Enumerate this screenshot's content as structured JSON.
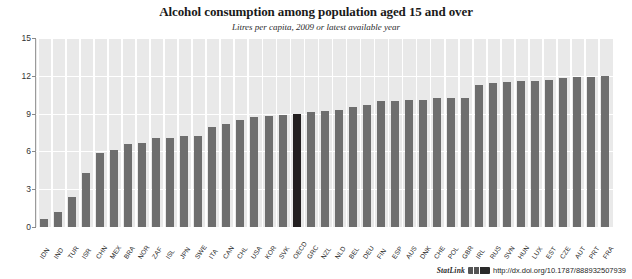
{
  "chart_data": {
    "type": "bar",
    "title": "Alcohol consumption among population aged 15 and over",
    "subtitle": "Litres per capita, 2009 or latest available year",
    "xlabel": "",
    "ylabel": "",
    "ylim": [
      0,
      15
    ],
    "yticks": [
      0,
      3,
      6,
      9,
      12,
      15
    ],
    "grid": "horizontal-and-vertical-white",
    "legend": "none",
    "bar_color": "#6e6e6e",
    "highlight_color": "#231f20",
    "plot_background": "#e9e9e9",
    "highlight_category": "OECD",
    "categories": [
      "IDN",
      "IND",
      "TUR",
      "ISR",
      "CHN",
      "MEX",
      "BRA",
      "NOR",
      "ZAF",
      "ISL",
      "JPN",
      "SWE",
      "ITA",
      "CAN",
      "CHL",
      "USA",
      "KOR",
      "SVK",
      "OECD",
      "GRC",
      "NZL",
      "NLD",
      "BEL",
      "DEU",
      "FIN",
      "ESP",
      "AUS",
      "DNK",
      "CHE",
      "POL",
      "GBR",
      "IRL",
      "RUS",
      "SVN",
      "HUN",
      "LUX",
      "EST",
      "CZE",
      "AUT",
      "PRT",
      "FRA"
    ],
    "values": [
      0.6,
      1.2,
      2.4,
      4.3,
      5.9,
      6.1,
      6.6,
      6.7,
      7.1,
      7.1,
      7.2,
      7.2,
      7.9,
      8.2,
      8.5,
      8.7,
      8.8,
      8.9,
      9.0,
      9.1,
      9.2,
      9.3,
      9.5,
      9.7,
      10.0,
      10.0,
      10.1,
      10.1,
      10.2,
      10.2,
      10.2,
      11.3,
      11.4,
      11.5,
      11.6,
      11.6,
      11.7,
      11.8,
      11.9,
      11.9,
      12.0
    ],
    "units": "litres per capita"
  },
  "footer": {
    "statlink_label": "StatLink",
    "statlink_icon": "statlink-barcode-icon",
    "url": "http://dx.doi.org/10.1787/888932507939"
  }
}
